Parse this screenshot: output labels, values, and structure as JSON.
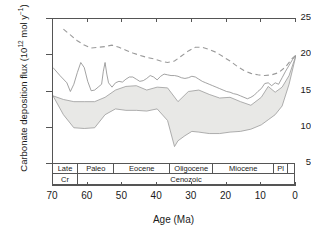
{
  "chart_data": {
    "type": "line",
    "title": "",
    "xlabel": "Age (Ma)",
    "ylabel": "Carbonate deposition flux (10^12 mol y^-1)",
    "ylabel_main": "Carbonate deposition flux (10",
    "ylabel_sup1": "12",
    "ylabel_mid": " mol y",
    "ylabel_sup2": "−1",
    "ylabel_end": ")",
    "xlim": [
      70,
      0
    ],
    "xlim_reversed": true,
    "ylim": [
      5,
      25
    ],
    "grid": false,
    "legend": "none",
    "xticks": [
      70,
      60,
      50,
      40,
      30,
      20,
      10,
      0
    ],
    "xtick_labels": [
      "70",
      "60",
      "50",
      "40",
      "30",
      "20",
      "10",
      "0"
    ],
    "yticks": [
      5,
      10,
      15,
      20,
      25
    ],
    "ytick_labels": [
      "5",
      "10",
      "15",
      "20",
      "25"
    ],
    "series": [
      {
        "name": "upper-solid-line",
        "style": "solid",
        "color": "#8c8c8c",
        "x": [
          70,
          68,
          66,
          65,
          64,
          63,
          62,
          61,
          60,
          59,
          58,
          57,
          56,
          55.5,
          55,
          54.5,
          54,
          53,
          52,
          51,
          50,
          49,
          48,
          47,
          46,
          45,
          44,
          43,
          42,
          41,
          40,
          39,
          38,
          37,
          36,
          35,
          34,
          33,
          32,
          31,
          30,
          29,
          28,
          27,
          26,
          25,
          24,
          23,
          22,
          21,
          20,
          19,
          18,
          17,
          16,
          15,
          14,
          13,
          12,
          11,
          10,
          9,
          8,
          7,
          6,
          5,
          4,
          3,
          2,
          1,
          0
        ],
        "y": [
          18.3,
          17.2,
          16.2,
          15.0,
          16.0,
          17.6,
          19.0,
          18.3,
          16.4,
          15.1,
          15.2,
          15.6,
          16.0,
          17.8,
          19.0,
          17.4,
          16.2,
          15.6,
          16.2,
          16.4,
          16.3,
          16.7,
          17.0,
          17.0,
          16.7,
          16.4,
          16.5,
          16.8,
          17.2,
          17.0,
          16.6,
          17.1,
          17.4,
          17.3,
          17.2,
          17.2,
          17.1,
          16.9,
          16.8,
          16.9,
          17.1,
          17.0,
          16.7,
          16.4,
          16.2,
          16.0,
          15.8,
          15.6,
          15.4,
          15.2,
          15.0,
          14.9,
          14.7,
          14.6,
          14.4,
          14.2,
          14.0,
          14.2,
          14.5,
          15.0,
          15.4,
          16.1,
          16.2,
          15.8,
          16.2,
          16.0,
          16.9,
          17.8,
          18.6,
          19.4,
          20.0
        ]
      },
      {
        "name": "band-upper-bound",
        "style": "solid",
        "color": "#9a9a9a",
        "x": [
          70,
          67,
          64,
          61,
          58,
          55,
          52,
          49,
          46,
          43,
          40,
          37,
          34,
          31,
          28,
          25,
          22,
          19,
          16,
          13,
          10,
          8,
          6,
          4,
          2,
          0
        ],
        "y": [
          14.4,
          13.9,
          13.6,
          13.6,
          13.6,
          14.2,
          15.2,
          15.7,
          15.8,
          15.2,
          15.6,
          15.5,
          13.6,
          15.0,
          15.2,
          14.6,
          14.1,
          14.2,
          13.6,
          13.1,
          14.2,
          15.7,
          14.9,
          15.6,
          17.2,
          20.0
        ]
      },
      {
        "name": "band-lower-bound",
        "style": "solid",
        "color": "#9a9a9a",
        "x": [
          70,
          67,
          64,
          61,
          58,
          55,
          52,
          49,
          46,
          43,
          40,
          37,
          35,
          34,
          32,
          30,
          28,
          25,
          22,
          19,
          16,
          13,
          10,
          8,
          6,
          4,
          2,
          0
        ],
        "y": [
          14.4,
          11.8,
          10.0,
          9.9,
          10.0,
          11.8,
          12.6,
          12.4,
          12.4,
          12.3,
          12.6,
          11.0,
          7.4,
          8.2,
          8.9,
          9.5,
          9.4,
          9.2,
          9.2,
          9.4,
          9.5,
          9.8,
          10.4,
          11.1,
          11.8,
          13.0,
          16.0,
          20.0
        ]
      },
      {
        "name": "dashed-line",
        "style": "dashed",
        "color": "#9a9a9a",
        "x": [
          67,
          65,
          63,
          61,
          59,
          57,
          55,
          53,
          51,
          49,
          47,
          45,
          43,
          41,
          39,
          37,
          35,
          33,
          31,
          29,
          27,
          25,
          23,
          21,
          19,
          17,
          15,
          13,
          11,
          9,
          7,
          5,
          3,
          1,
          0
        ],
        "y": [
          23.6,
          22.8,
          22.0,
          21.4,
          21.0,
          21.1,
          21.2,
          21.4,
          21.1,
          20.7,
          20.3,
          20.0,
          19.7,
          19.5,
          19.2,
          19.0,
          19.2,
          19.9,
          20.6,
          21.1,
          21.1,
          20.8,
          20.4,
          19.8,
          19.2,
          18.5,
          17.9,
          17.5,
          17.3,
          17.2,
          17.3,
          17.6,
          18.4,
          19.6,
          20.0
        ]
      }
    ],
    "band_fill_color": "#e8e8e6",
    "timescale": {
      "epoch_row_name": "epoch",
      "epochs": [
        {
          "label": "Late",
          "start": 70,
          "end": 62.5
        },
        {
          "label": "Paleo",
          "start": 62.5,
          "end": 52
        },
        {
          "label": "Eocene",
          "start": 52,
          "end": 36
        },
        {
          "label": "Oligocene",
          "start": 36,
          "end": 23.5
        },
        {
          "label": "Miocene",
          "start": 23.5,
          "end": 6
        },
        {
          "label": "Pl",
          "start": 6,
          "end": 2
        },
        {
          "label": "",
          "start": 2,
          "end": 0
        }
      ],
      "period_row_name": "period",
      "periods": [
        {
          "label": "Cr",
          "start": 70,
          "end": 62.5
        },
        {
          "label": "Cenozoic",
          "start": 62.5,
          "end": 0
        }
      ]
    }
  },
  "axis": {
    "line_color": "#555555",
    "text_color": "#1a1a1a"
  }
}
